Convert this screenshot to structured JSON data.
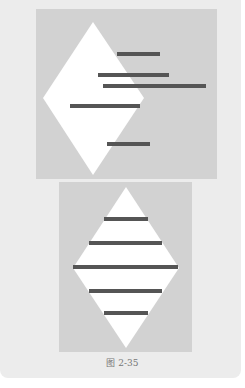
{
  "figure": {
    "caption": "图 2-35",
    "colors": {
      "page_background": "#ececec",
      "panel_background": "#d2d2d2",
      "diamond_fill": "#ffffff",
      "bar_fill": "#555555"
    },
    "top_panel": {
      "description": "White diamond offset to the left with five horizontal dark bars arranged asymmetrically",
      "bounds": {
        "x": 36,
        "y": 9,
        "w": 181,
        "h": 170
      },
      "diamond": {
        "top": [
          93,
          22
        ],
        "right": [
          144,
          98
        ],
        "bottom": [
          93,
          175
        ],
        "left": [
          43,
          98
        ]
      },
      "bars": [
        {
          "x1": 117,
          "x2": 160,
          "y": 53
        },
        {
          "x1": 98,
          "x2": 169,
          "y": 74
        },
        {
          "x1": 103,
          "x2": 206,
          "y": 85
        },
        {
          "x1": 70,
          "x2": 140,
          "y": 106
        },
        {
          "x1": 107,
          "x2": 150,
          "y": 144
        }
      ]
    },
    "bottom_panel": {
      "description": "Centered white diamond with five symmetric horizontal dark bars",
      "bounds": {
        "x": 59,
        "y": 182,
        "w": 133,
        "h": 170
      },
      "diamond": {
        "top": [
          126,
          187
        ],
        "right": [
          179,
          268
        ],
        "bottom": [
          126,
          348
        ],
        "left": [
          73,
          268
        ]
      },
      "bars": [
        {
          "x1": 104,
          "x2": 148,
          "y": 219
        },
        {
          "x1": 89,
          "x2": 162,
          "y": 243
        },
        {
          "x1": 73,
          "x2": 178,
          "y": 267
        },
        {
          "x1": 89,
          "x2": 162,
          "y": 291
        },
        {
          "x1": 104,
          "x2": 148,
          "y": 313
        }
      ]
    }
  }
}
